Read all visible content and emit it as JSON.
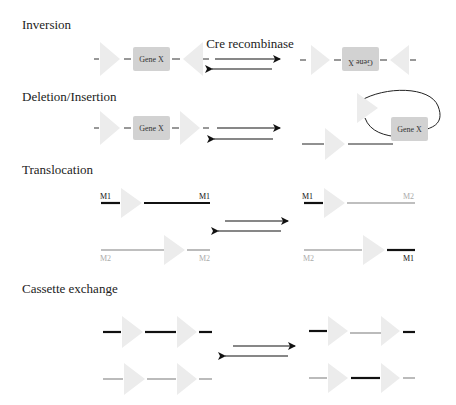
{
  "diagram": {
    "colors": {
      "loxp": "#ececec",
      "gene_box": "#d2d2d2",
      "dark_line": "#111111",
      "light_line": "#aaaaaa",
      "arrow": "#111111"
    },
    "sections": [
      {
        "id": "inversion",
        "title": "Inversion",
        "arrow_label": "Cre recombinase",
        "gene_label": "Gene X",
        "gene_label_inverted": "Gene X"
      },
      {
        "id": "deletion",
        "title": "Deletion/Insertion",
        "gene_label": "Gene X",
        "gene_label_excised": "Gene X"
      },
      {
        "id": "translocation",
        "title": "Translocation",
        "labels": {
          "left_top_start": "M1",
          "left_top_end": "M1",
          "left_bottom_start": "M2",
          "left_bottom_end": "M2",
          "right_top_start": "M1",
          "right_top_end": "M2",
          "right_bottom_start": "M2",
          "right_bottom_end": "M1"
        }
      },
      {
        "id": "cassette",
        "title": "Cassette exchange"
      }
    ]
  }
}
